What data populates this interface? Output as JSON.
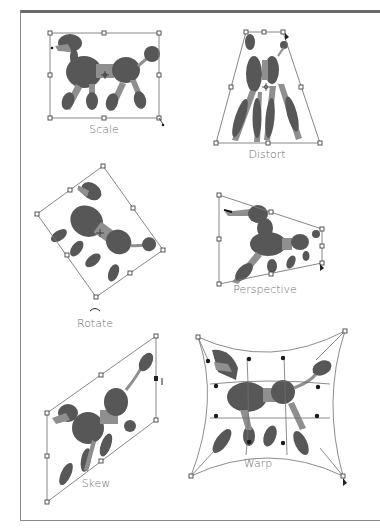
{
  "figure": {
    "panels": [
      {
        "id": "scale",
        "label": "Scale"
      },
      {
        "id": "distort",
        "label": "Distort"
      },
      {
        "id": "rotate",
        "label": "Rotate"
      },
      {
        "id": "perspective",
        "label": "Perspective"
      },
      {
        "id": "skew",
        "label": "Skew"
      },
      {
        "id": "warp",
        "label": "Warp"
      }
    ]
  },
  "icons": {
    "reference_point": "crosshair-center-icon",
    "rotate_cursor": "rotate-cursor-icon",
    "arrow_cursor": "arrow-cursor-icon",
    "skew_cursor": "skew-cursor-icon"
  },
  "colors": {
    "poodle_dark": "#575757",
    "poodle_light": "#8f8f8f",
    "bbox": "#7a7a7a",
    "label": "#6b6b6b",
    "frame": "#6a6a6a"
  }
}
